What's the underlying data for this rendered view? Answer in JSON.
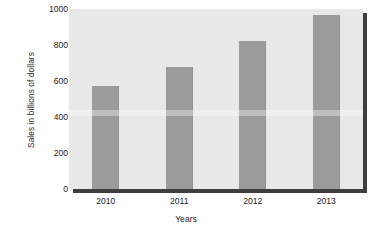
{
  "chart_data": {
    "type": "bar",
    "title": "",
    "categories": [
      "2010",
      "2011",
      "2012",
      "2013"
    ],
    "values": [
      570,
      680,
      820,
      965
    ],
    "series": [
      {
        "name": "Sales",
        "values": [
          570,
          680,
          820,
          965
        ]
      }
    ],
    "xlabel": "Years",
    "ylabel": "Sales in billions of dollars",
    "ylim": [
      0,
      1000
    ],
    "yticks": [
      0,
      200,
      400,
      600,
      800,
      1000
    ],
    "ytick_labels": [
      "0",
      "200",
      "400",
      "600",
      "800",
      "1000"
    ],
    "grid": false,
    "legend": null,
    "legend_position": "none",
    "bar_color": "#9b9b9b",
    "plot_background": "#e8e8e6",
    "figure_background": "#ffffff",
    "axis_color": "#3a3a3a",
    "shadow_color": "#3e3e3e",
    "text_color": "#1d1d1d"
  }
}
